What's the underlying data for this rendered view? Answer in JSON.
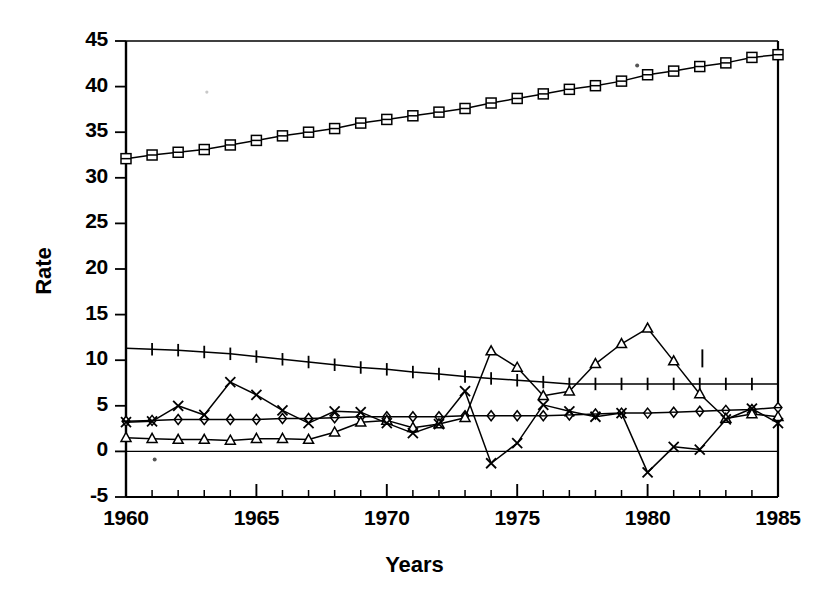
{
  "chart_data": {
    "type": "line",
    "title": "",
    "xlabel": "Years",
    "ylabel": "Rate",
    "xlim": [
      1960,
      1985
    ],
    "ylim": [
      -5,
      45
    ],
    "ytick_labels": [
      "45",
      "40",
      "35",
      "30",
      "25",
      "20",
      "15",
      "10",
      "5",
      "0",
      "-5"
    ],
    "ytick_values": [
      45,
      40,
      35,
      30,
      25,
      20,
      15,
      10,
      5,
      0,
      -5
    ],
    "ytick_step": 5,
    "xtick_labels": [
      "1960",
      "1965",
      "1970",
      "1975",
      "1980",
      "1985"
    ],
    "xtick_values": [
      1960,
      1965,
      1970,
      1975,
      1980,
      1985
    ],
    "xtick_minor_step": 1,
    "grid": false,
    "legend": "none",
    "x": [
      1960,
      1961,
      1962,
      1963,
      1964,
      1965,
      1966,
      1967,
      1968,
      1969,
      1970,
      1971,
      1972,
      1973,
      1974,
      1975,
      1976,
      1977,
      1978,
      1979,
      1980,
      1981,
      1982,
      1983,
      1984,
      1985
    ],
    "series": [
      {
        "name": "square-series",
        "marker": "square",
        "values": [
          32.1,
          32.5,
          32.8,
          33.1,
          33.6,
          34.1,
          34.6,
          35.0,
          35.4,
          36.0,
          36.4,
          36.8,
          37.2,
          37.6,
          38.2,
          38.7,
          39.2,
          39.7,
          40.1,
          40.6,
          41.3,
          41.7,
          42.2,
          42.6,
          43.2,
          43.5
        ]
      },
      {
        "name": "plus-series",
        "marker": "plus",
        "values": [
          11.3,
          11.2,
          11.1,
          10.9,
          10.7,
          10.4,
          10.1,
          9.8,
          9.5,
          9.2,
          9.0,
          8.7,
          8.5,
          8.2,
          8.0,
          7.8,
          7.6,
          7.4,
          7.4,
          7.4,
          7.4,
          7.4,
          7.4,
          7.4,
          7.4,
          7.4
        ]
      },
      {
        "name": "diamond-series",
        "marker": "diamond",
        "values": [
          3.3,
          3.4,
          3.5,
          3.5,
          3.5,
          3.5,
          3.6,
          3.6,
          3.7,
          3.8,
          3.8,
          3.8,
          3.8,
          3.9,
          3.9,
          3.9,
          3.9,
          4.0,
          4.1,
          4.2,
          4.2,
          4.3,
          4.4,
          4.5,
          4.6,
          4.8
        ]
      },
      {
        "name": "triangle-series",
        "marker": "triangle",
        "values": [
          1.5,
          1.4,
          1.3,
          1.3,
          1.2,
          1.4,
          1.4,
          1.3,
          2.1,
          3.2,
          3.4,
          2.6,
          3.0,
          3.7,
          11.0,
          9.2,
          6.1,
          6.6,
          9.6,
          11.8,
          13.5,
          9.9,
          6.3,
          3.6,
          4.1,
          3.8
        ]
      },
      {
        "name": "x-series",
        "marker": "x",
        "values": [
          3.2,
          3.3,
          5.0,
          4.0,
          7.6,
          6.2,
          4.5,
          3.1,
          4.4,
          4.3,
          3.1,
          2.0,
          3.0,
          6.6,
          -1.3,
          0.9,
          5.1,
          4.4,
          3.8,
          4.2,
          -2.3,
          0.5,
          0.2,
          3.5,
          4.7,
          3.1
        ]
      }
    ],
    "annotations": [
      {
        "name": "stray-tick-mark",
        "x": 1982.1,
        "y": 10.2
      },
      {
        "name": "stray-dot-upper",
        "x": 1979.6,
        "y": 42.3
      },
      {
        "name": "stray-dot-lower",
        "x": 1961.1,
        "y": -0.9
      },
      {
        "name": "stray-dot-faint-left",
        "x": 1963.1,
        "y": 39.4
      }
    ]
  }
}
